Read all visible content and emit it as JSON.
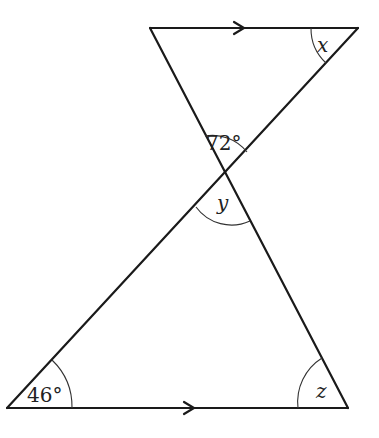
{
  "diagram": {
    "type": "geometry-parallel-lines-intersecting-transversals",
    "labels": {
      "top_right_angle": "x",
      "upper_vertical_angle": "72°",
      "lower_vertical_angle": "y",
      "bottom_left_angle": "46°",
      "bottom_right_angle": "z"
    },
    "parallel_markers": [
      "top-arrow",
      "bottom-arrow"
    ],
    "colors": {
      "line": "#1a1a1a",
      "background": "#ffffff"
    }
  }
}
